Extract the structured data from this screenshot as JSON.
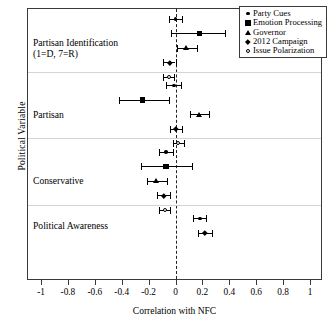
{
  "chart_data": {
    "type": "scatter",
    "title": "",
    "xlabel": "Correlation with NFC",
    "ylabel": "Political Variable",
    "xlim": [
      -1,
      1
    ],
    "grid": false,
    "legend_position": "top-right",
    "zero_reference_line": 0,
    "xticks": [
      -1,
      -0.8,
      -0.6,
      -0.4,
      -0.2,
      0,
      0.2,
      0.4,
      0.6,
      0.8,
      1
    ],
    "xticklabels": [
      "-1",
      "-0.8",
      "-0.6",
      "-0.4",
      "-0.2",
      "0",
      "0.2",
      "0.4",
      "0.6",
      "0.8",
      "1"
    ],
    "legend": [
      {
        "name": "Party Cues",
        "marker": "circle-small"
      },
      {
        "name": "Emotion Processing",
        "marker": "square"
      },
      {
        "name": "Governor",
        "marker": "triangle"
      },
      {
        "name": "2012 Campaign",
        "marker": "diamond"
      },
      {
        "name": "Issue Polarization",
        "marker": "open-circle"
      }
    ],
    "groups": [
      {
        "label": "Partisan Identification\n(1=D, 7=R)",
        "points": [
          {
            "series": "Party Cues",
            "marker": "circle-small",
            "value": 0.0,
            "ci_low": -0.05,
            "ci_high": 0.05
          },
          {
            "series": "Emotion Processing",
            "marker": "square",
            "value": 0.18,
            "ci_low": -0.03,
            "ci_high": 0.37
          },
          {
            "series": "Governor",
            "marker": "triangle",
            "value": 0.08,
            "ci_low": 0.01,
            "ci_high": 0.16
          },
          {
            "series": "2012 Campaign",
            "marker": "diamond",
            "value": -0.04,
            "ci_low": -0.09,
            "ci_high": 0.0
          },
          {
            "series": "Issue Polarization",
            "marker": "open-circle",
            "value": -0.05,
            "ci_low": -0.09,
            "ci_high": -0.01
          }
        ]
      },
      {
        "label": "Partisan",
        "points": [
          {
            "series": "Party Cues",
            "marker": "circle-small",
            "value": -0.01,
            "ci_low": -0.07,
            "ci_high": 0.04
          },
          {
            "series": "Emotion Processing",
            "marker": "square",
            "value": -0.245,
            "ci_low": -0.42,
            "ci_high": -0.05
          },
          {
            "series": "Governor",
            "marker": "triangle",
            "value": 0.18,
            "ci_low": 0.11,
            "ci_high": 0.25
          },
          {
            "series": "2012 Campaign",
            "marker": "diamond",
            "value": 0.0,
            "ci_low": -0.04,
            "ci_high": 0.05
          },
          {
            "series": "Issue Polarization",
            "marker": "open-circle",
            "value": 0.02,
            "ci_low": -0.02,
            "ci_high": 0.06
          }
        ]
      },
      {
        "label": "Conservative",
        "points": [
          {
            "series": "Party Cues",
            "marker": "circle-small",
            "value": -0.07,
            "ci_low": -0.12,
            "ci_high": -0.02
          },
          {
            "series": "Emotion Processing",
            "marker": "square",
            "value": -0.07,
            "ci_low": -0.26,
            "ci_high": 0.12
          },
          {
            "series": "Governor",
            "marker": "triangle",
            "value": -0.14,
            "ci_low": -0.21,
            "ci_high": -0.06
          },
          {
            "series": "2012 Campaign",
            "marker": "diamond",
            "value": -0.09,
            "ci_low": -0.14,
            "ci_high": -0.04
          },
          {
            "series": "Issue Polarization",
            "marker": "open-circle",
            "value": -0.08,
            "ci_low": -0.12,
            "ci_high": -0.04
          }
        ]
      },
      {
        "label": "Political Awareness",
        "points": [
          {
            "series": "Party Cues",
            "marker": "circle-small",
            "value": 0.18,
            "ci_low": 0.13,
            "ci_high": 0.23
          },
          {
            "series": "2012 Campaign",
            "marker": "diamond",
            "value": 0.22,
            "ci_low": 0.17,
            "ci_high": 0.27
          }
        ]
      }
    ]
  }
}
